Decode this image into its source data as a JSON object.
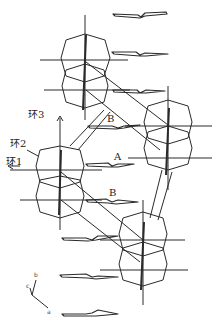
{
  "diagram": {
    "type": "crystal-packing",
    "labels": {
      "ring1": "环1",
      "ring2": "环2",
      "ring3": "环3",
      "contact_A": "A",
      "contact_B_upper": "B",
      "contact_B_lower": "B"
    },
    "axes": {
      "b": "b",
      "c": "c",
      "a": "a"
    },
    "colors": {
      "line": "#2a2a2a",
      "background": "#ffffff"
    }
  }
}
